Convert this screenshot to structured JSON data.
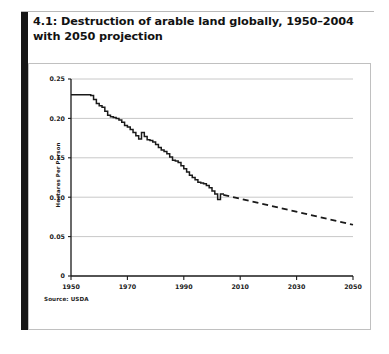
{
  "figure": {
    "number": "4.1:",
    "caption": "4.1: Destruction of arable land globally, 1950–2004 with 2050 projection",
    "caption_text": " Destruction of arable land globally, 1950–2004 with 2050 projection",
    "source_note": "Source: USDA"
  },
  "colors": {
    "line": "#1a1a1a",
    "gridline": "#c8c8c8",
    "axis": "#1a1a1a",
    "accent_bar": "#151515",
    "panel_border": "#c0c0c0",
    "background": "#ffffff"
  },
  "chart_data": {
    "type": "line",
    "title": "Destruction of arable land globally, 1950–2004 with 2050 projection",
    "xlabel": "",
    "ylabel": "Hectares Per Person",
    "xlim": [
      1950,
      2050
    ],
    "ylim": [
      0,
      0.25
    ],
    "grid": true,
    "legend": "none",
    "source": "Source: USDA",
    "y_ticks": [
      0,
      0.05,
      0.1,
      0.15,
      0.2,
      0.25
    ],
    "y_tick_labels": [
      "0",
      "0.05",
      "0.10",
      "0.15",
      "0.20",
      "0.25"
    ],
    "x_ticks": [
      1950,
      1970,
      1990,
      2010,
      2030,
      2050
    ],
    "x_tick_labels": [
      "1950",
      "1970",
      "1990",
      "2010",
      "2030",
      "2050"
    ],
    "series": [
      {
        "name": "Historical (1950–2004)",
        "style": "solid",
        "x": [
          1950,
          1951,
          1952,
          1953,
          1954,
          1955,
          1956,
          1957,
          1958,
          1959,
          1960,
          1961,
          1962,
          1963,
          1964,
          1965,
          1966,
          1967,
          1968,
          1969,
          1970,
          1971,
          1972,
          1973,
          1974,
          1975,
          1976,
          1977,
          1978,
          1979,
          1980,
          1981,
          1982,
          1983,
          1984,
          1985,
          1986,
          1987,
          1988,
          1989,
          1990,
          1991,
          1992,
          1993,
          1994,
          1995,
          1996,
          1997,
          1998,
          1999,
          2000,
          2001,
          2002,
          2003,
          2004
        ],
        "values": [
          0.23,
          0.23,
          0.23,
          0.23,
          0.23,
          0.23,
          0.23,
          0.229,
          0.224,
          0.219,
          0.216,
          0.214,
          0.209,
          0.204,
          0.202,
          0.201,
          0.2,
          0.198,
          0.195,
          0.191,
          0.189,
          0.186,
          0.182,
          0.178,
          0.174,
          0.182,
          0.177,
          0.173,
          0.172,
          0.17,
          0.167,
          0.163,
          0.16,
          0.158,
          0.155,
          0.151,
          0.147,
          0.146,
          0.144,
          0.14,
          0.136,
          0.132,
          0.128,
          0.125,
          0.122,
          0.119,
          0.118,
          0.117,
          0.115,
          0.112,
          0.108,
          0.104,
          0.097,
          0.104,
          0.103
        ]
      },
      {
        "name": "Projection (2004–2050)",
        "style": "dashed",
        "x": [
          2004,
          2050
        ],
        "values": [
          0.103,
          0.065
        ]
      }
    ]
  }
}
